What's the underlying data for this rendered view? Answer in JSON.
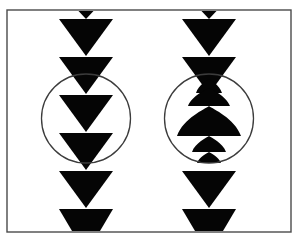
{
  "figure": {
    "canvas": {
      "width": 298,
      "height": 238,
      "background": "#ffffff"
    },
    "frame": {
      "name": "outer-rectangle-frame",
      "x": 7,
      "y": 10,
      "width": 284,
      "height": 222,
      "stroke": "#4a4a4a",
      "stroke_width": 1.4,
      "fill": "none"
    },
    "ink_color": "#050505",
    "circle_stroke": "#3c3c3c",
    "circle_stroke_width": 1.3,
    "columns": [
      {
        "name": "left-column",
        "label": "Left column — undistorted triangles",
        "center_x": 86,
        "circle": {
          "cx": 86,
          "cy": 118.5,
          "r": 44.5
        },
        "shapes": [
          {
            "kind": "triangle-down",
            "name": "tip-triangle",
            "cy_top": 11,
            "half_width": 7.5,
            "height": 8
          },
          {
            "kind": "triangle-down",
            "name": "triangle-1",
            "cy_top": 19,
            "half_width": 27,
            "height": 37
          },
          {
            "kind": "triangle-down",
            "name": "triangle-2",
            "cy_top": 57,
            "half_width": 27,
            "height": 37
          },
          {
            "kind": "triangle-down",
            "name": "triangle-3",
            "cy_top": 95,
            "half_width": 27,
            "height": 37
          },
          {
            "kind": "triangle-down",
            "name": "triangle-4",
            "cy_top": 133,
            "half_width": 27,
            "height": 37
          },
          {
            "kind": "triangle-down",
            "name": "triangle-5",
            "cy_top": 171,
            "half_width": 27,
            "height": 37
          },
          {
            "kind": "trapezoid-down",
            "name": "bottom-trapezoid",
            "cy_top": 209,
            "half_width": 27,
            "height": 22,
            "bottom_half_width": 14
          }
        ]
      },
      {
        "name": "right-column",
        "label": "Right column — triangles distorted inside circle",
        "center_x": 209,
        "circle": {
          "cx": 209,
          "cy": 118.5,
          "r": 44.5
        },
        "shapes": [
          {
            "kind": "triangle-down",
            "name": "tip-triangle",
            "cy_top": 11,
            "half_width": 7.5,
            "height": 8
          },
          {
            "kind": "triangle-down",
            "name": "triangle-1",
            "cy_top": 19,
            "half_width": 27,
            "height": 37
          },
          {
            "kind": "triangle-down",
            "name": "triangle-2",
            "cy_top": 57,
            "half_width": 27,
            "height": 37
          },
          {
            "kind": "dome-up",
            "name": "dome-small-top",
            "cy_top": 79,
            "half_width": 13,
            "height": 14
          },
          {
            "kind": "dome-up",
            "name": "dome-medium",
            "cy_top": 88,
            "half_width": 21,
            "height": 18
          },
          {
            "kind": "dome-up",
            "name": "dome-large",
            "cy_top": 106,
            "half_width": 32,
            "height": 30
          },
          {
            "kind": "dome-up",
            "name": "dome-small-low",
            "cy_top": 136,
            "half_width": 17,
            "height": 16
          },
          {
            "kind": "dome-up",
            "name": "dome-tiny-low",
            "cy_top": 152,
            "half_width": 12,
            "height": 11
          },
          {
            "kind": "triangle-down",
            "name": "triangle-5",
            "cy_top": 171,
            "half_width": 27,
            "height": 37
          },
          {
            "kind": "trapezoid-down",
            "name": "bottom-trapezoid",
            "cy_top": 209,
            "half_width": 27,
            "height": 22,
            "bottom_half_width": 14
          }
        ]
      }
    ]
  }
}
